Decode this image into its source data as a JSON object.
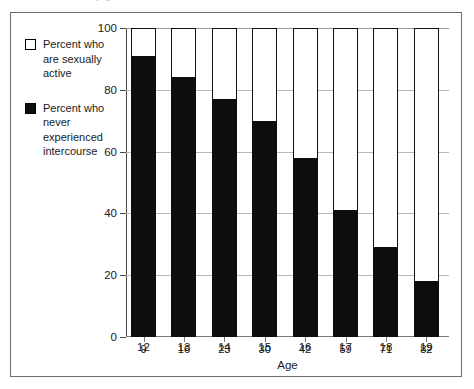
{
  "figure": {
    "top_cut_text": "y g",
    "frame_color": "#6e6e6e",
    "background": "#ffffff"
  },
  "legend": {
    "entries": [
      {
        "swatch": "hollow-square-icon",
        "style": "hollow",
        "label": "Percent who are sexually active"
      },
      {
        "swatch": "filled-square-icon",
        "style": "filled",
        "label": "Percent who never experienced intercourse"
      }
    ]
  },
  "chart_data": {
    "type": "bar",
    "subtype": "stacked-bar",
    "title": "",
    "xlabel": "Age",
    "ylabel": "",
    "categories": [
      "12",
      "13",
      "14",
      "15",
      "16",
      "17",
      "18",
      "19"
    ],
    "ylim": [
      0,
      100
    ],
    "yticks": [
      0,
      20,
      40,
      60,
      80,
      100
    ],
    "ytick_labels": [
      "0",
      "20",
      "40",
      "60",
      "80",
      "100"
    ],
    "grid": true,
    "grid_axis": "y",
    "legend_position": "upper-left-outside",
    "data_labels": [
      9,
      16,
      23,
      30,
      42,
      59,
      71,
      82
    ],
    "series": [
      {
        "name": "Percent who never experienced intercourse",
        "color": "#0d0d0d",
        "values": [
          91,
          84,
          77,
          70,
          58,
          41,
          29,
          18
        ]
      },
      {
        "name": "Percent who are sexually active",
        "color": "#ffffff",
        "values": [
          9,
          16,
          23,
          30,
          42,
          59,
          71,
          82
        ]
      }
    ],
    "colors": {
      "sexually_active": "#ffffff",
      "never_experienced_intercourse": "#0d0d0d",
      "bar_outline": "#111111",
      "gridline": "#b9b9b9",
      "axis": "#4a4a4a"
    }
  }
}
